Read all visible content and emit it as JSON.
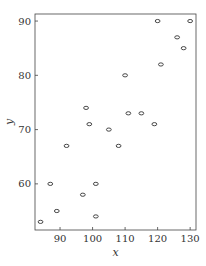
{
  "chart_data": {
    "type": "scatter",
    "title": "",
    "xlabel": "x",
    "ylabel": "y",
    "xlim": [
      82.3,
      131.8
    ],
    "ylim": [
      51.5,
      91.3
    ],
    "xticks": [
      90,
      100,
      110,
      120,
      130
    ],
    "yticks": [
      60,
      70,
      80,
      90
    ],
    "grid": false,
    "legend": null,
    "marker": "open-ellipse",
    "points": [
      {
        "x": 84,
        "y": 53
      },
      {
        "x": 87,
        "y": 60
      },
      {
        "x": 89,
        "y": 55
      },
      {
        "x": 92,
        "y": 67
      },
      {
        "x": 97,
        "y": 58
      },
      {
        "x": 98,
        "y": 74
      },
      {
        "x": 99,
        "y": 71
      },
      {
        "x": 101,
        "y": 60
      },
      {
        "x": 101,
        "y": 54
      },
      {
        "x": 105,
        "y": 70
      },
      {
        "x": 108,
        "y": 67
      },
      {
        "x": 110,
        "y": 80
      },
      {
        "x": 111,
        "y": 73
      },
      {
        "x": 115,
        "y": 73
      },
      {
        "x": 119,
        "y": 71
      },
      {
        "x": 120,
        "y": 90
      },
      {
        "x": 121,
        "y": 82
      },
      {
        "x": 126,
        "y": 87
      },
      {
        "x": 128,
        "y": 85
      },
      {
        "x": 130,
        "y": 90
      }
    ]
  }
}
